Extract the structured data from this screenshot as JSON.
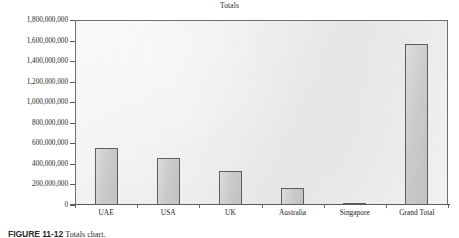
{
  "chart_data": {
    "type": "bar",
    "title": "Totals",
    "xlabel": "",
    "ylabel": "",
    "categories": [
      "UAE",
      "USA",
      "UK",
      "Australia",
      "Singapore",
      "Grand Total"
    ],
    "values": [
      550000000,
      460000000,
      335000000,
      170000000,
      18000000,
      1570000000
    ],
    "series": [
      {
        "name": "Totals",
        "values": [
          550000000,
          460000000,
          335000000,
          170000000,
          18000000,
          1570000000
        ]
      }
    ],
    "ylim": [
      0,
      1800000000
    ],
    "ytick_step": 200000000,
    "ytick_labels": [
      "1,800,000,000",
      "1,600,000,000",
      "1,400,000,000",
      "1,200,000,000",
      "1,000,000,000",
      "800,000,000",
      "600,000,000",
      "400,000,000",
      "200,000,000",
      "0"
    ],
    "ytick_values": [
      1800000000,
      1600000000,
      1400000000,
      1200000000,
      1000000000,
      800000000,
      600000000,
      400000000,
      200000000,
      0
    ],
    "grid": false,
    "legend": false,
    "legend_position": "none",
    "bar_fill_color": "#c8c8c8",
    "bar_border_color": "#5e5e5e",
    "plot_background_color": "#ececec",
    "plot_border_color": "#6f6f6f",
    "text_color": "#1d1d1d"
  },
  "caption": {
    "figure_number": "FIGURE 11-12",
    "figure_text": "Totals chart."
  }
}
